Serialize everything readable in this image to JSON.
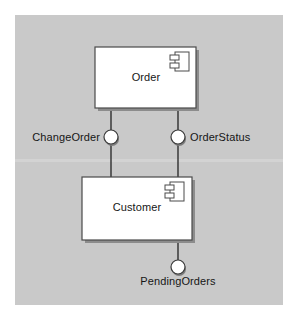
{
  "diagram": {
    "kind": "uml-component-diagram",
    "canvas": {
      "width": 299,
      "height": 323,
      "background_color": "#ffffff",
      "panel_color": "#c9c9c9"
    },
    "components": [
      {
        "id": "order",
        "name": "Order",
        "icon": "uml-component-icon",
        "fill_color": "#ffffff",
        "stroke_color": "#4a4a4a",
        "x": 95,
        "y": 47,
        "width": 101,
        "height": 61
      },
      {
        "id": "customer",
        "name": "Customer",
        "icon": "uml-component-icon",
        "fill_color": "#ffffff",
        "stroke_color": "#4a4a4a",
        "x": 82,
        "y": 177,
        "width": 110,
        "height": 63
      }
    ],
    "interfaces": [
      {
        "id": "change-order",
        "name": "ChangeOrder",
        "label_position": "left",
        "cx": 111,
        "cy": 137,
        "r": 7,
        "fill_color": "#ffffff",
        "stroke_color": "#3a3a3a"
      },
      {
        "id": "order-status",
        "name": "OrderStatus",
        "label_position": "right",
        "cx": 178,
        "cy": 137,
        "r": 7,
        "fill_color": "#ffffff",
        "stroke_color": "#3a3a3a"
      },
      {
        "id": "pending-orders",
        "name": "PendingOrders",
        "label_position": "below",
        "cx": 178,
        "cy": 267,
        "r": 7,
        "fill_color": "#ffffff",
        "stroke_color": "#3a3a3a"
      }
    ],
    "connectors": [
      {
        "id": "order-to-changeorder",
        "from": "order",
        "to": "change-order",
        "x1": 111,
        "y1": 108,
        "x2": 111,
        "y2": 130
      },
      {
        "id": "changeorder-to-customer",
        "from": "change-order",
        "to": "customer",
        "x1": 111,
        "y1": 144,
        "x2": 111,
        "y2": 177
      },
      {
        "id": "order-to-orderstatus",
        "from": "order",
        "to": "order-status",
        "x1": 178,
        "y1": 108,
        "x2": 178,
        "y2": 130
      },
      {
        "id": "orderstatus-to-customer",
        "from": "order-status",
        "to": "customer",
        "x1": 178,
        "y1": 144,
        "x2": 178,
        "y2": 177
      },
      {
        "id": "customer-to-pendingorders",
        "from": "customer",
        "to": "pending-orders",
        "x1": 178,
        "y1": 240,
        "x2": 178,
        "y2": 260
      }
    ]
  }
}
